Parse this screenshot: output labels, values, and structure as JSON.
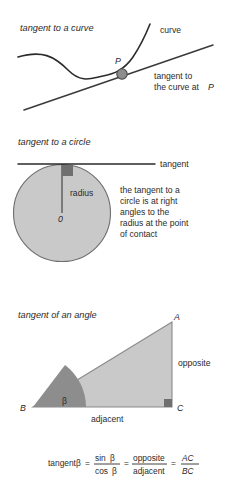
{
  "colors": {
    "background": "#ffffff",
    "ink": "#2b2b2b",
    "stroke": "#3a3a3a",
    "circle_fill": "#c9c9c9",
    "circle_stroke": "#6e6e6e",
    "triangle_fill": "#c9c9c9",
    "triangle_stroke": "#8a8a8a",
    "angle_wedge_fill": "#8d8d8d",
    "right_angle_fill": "#6f6f6f",
    "point_fill": "#8d8d8d",
    "point_stroke": "#4a4a4a"
  },
  "panels": [
    {
      "id": "curve",
      "heading": "tangent to a curve",
      "labels": {
        "point": "P",
        "curve": "curve",
        "tangent_line_1": "tangent to",
        "tangent_line_2": "the curve at",
        "tangent_point_ref": "P"
      }
    },
    {
      "id": "circle",
      "heading": "tangent to a circle",
      "labels": {
        "tangent": "tangent",
        "radius": "radius",
        "center": "0",
        "note_line_1": "the tangent to a",
        "note_line_2": "circle is at right",
        "note_line_3": "angles to the",
        "note_line_4": "radius at the point",
        "note_line_5": "of contact"
      }
    },
    {
      "id": "angle",
      "heading": "tangent of an angle",
      "labels": {
        "vertex_a": "A",
        "vertex_b": "B",
        "vertex_c": "C",
        "angle": "β",
        "opposite": "opposite",
        "adjacent": "adjacent"
      },
      "formula": {
        "lead": "tangent",
        "lead_symbol": "β",
        "equals_1": "=",
        "frac1_num": "sin",
        "frac1_num_symbol": "β",
        "frac1_den": "cos",
        "frac1_den_symbol": "β",
        "equals_2": "=",
        "frac2_num": "opposite",
        "frac2_den": "adjacent",
        "equals_3": "=",
        "frac3_num": "AC",
        "frac3_den": "BC"
      }
    }
  ]
}
